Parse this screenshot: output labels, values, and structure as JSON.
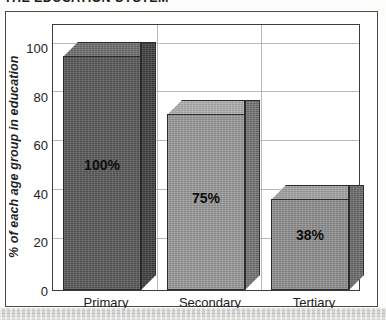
{
  "document": {
    "title": "THE EDUCATION SYSTEM"
  },
  "chart_data": {
    "type": "bar",
    "title": "THE EDUCATION SYSTEM",
    "categories": [
      "Primary",
      "Secondary",
      "Tertiary"
    ],
    "values": [
      100,
      75,
      38
    ],
    "data_labels": [
      "100%",
      "75%",
      "38%"
    ],
    "xlabel": "",
    "ylabel": "% of each age group in education",
    "ylim": [
      0,
      110
    ],
    "yticks": [
      0,
      20,
      40,
      60,
      80,
      100
    ],
    "ytick_labels": [
      "0",
      "20",
      "40",
      "60",
      "80",
      "100"
    ],
    "grid": true,
    "legend": false,
    "style": "3d-bar",
    "series": [
      {
        "name": "% of each age group in education",
        "values": [
          100,
          75,
          38
        ]
      }
    ],
    "bar_colors": [
      "#595959",
      "#9a9a9a",
      "#8f8f8f"
    ],
    "bar_top_colors": [
      "#6e6e6e",
      "#b0b0b0",
      "#a4a4a4"
    ],
    "bar_side_colors": [
      "#3f3f3f",
      "#747474",
      "#6b6b6b"
    ],
    "axis_color": "#3d3d3d",
    "grid_color": "#b9b9b9"
  }
}
